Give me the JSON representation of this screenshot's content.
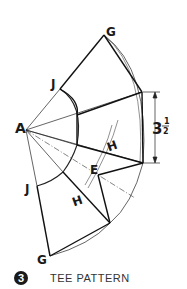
{
  "diagram": {
    "labels": {
      "A": "A",
      "G_top": "G",
      "J_top": "J",
      "J_bottom": "J",
      "G_bottom": "G",
      "E": "E",
      "H_upper": "H",
      "H_lower": "H",
      "dimension": "3",
      "dimension_frac_num": "1",
      "dimension_frac_den": "2"
    },
    "colors": {
      "line": "#1a1a1a",
      "construction": "#333333"
    }
  },
  "caption": {
    "number": "3",
    "text": "TEE PATTERN"
  }
}
